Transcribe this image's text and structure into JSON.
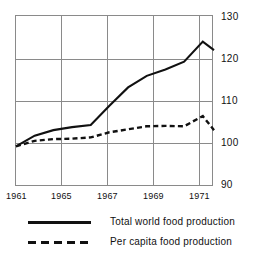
{
  "chart_data": {
    "type": "line",
    "title": "",
    "xlabel": "",
    "ylabel": "",
    "xlim": [
      1961,
      1971.6
    ],
    "ylim": [
      90,
      130
    ],
    "ytick_values": [
      130,
      120,
      110,
      100,
      90
    ],
    "ytick_labels": [
      "130",
      "120",
      "110",
      "100",
      "90"
    ],
    "xtick_values": [
      1961,
      1965,
      1967,
      1969,
      1971
    ],
    "xtick_labels": [
      "1961",
      "1965",
      "1967",
      "1969",
      "1971"
    ],
    "grid": "both",
    "legend_position": "below",
    "series": [
      {
        "name": "Total world food production",
        "style": "solid",
        "color": "#111111",
        "x": [
          1961,
          1962,
          1963,
          1964,
          1965,
          1966,
          1967,
          1968,
          1969,
          1970,
          1971,
          1971.6
        ],
        "values": [
          99.5,
          102.0,
          103.3,
          104.0,
          104.5,
          109.0,
          113.3,
          116.0,
          117.5,
          119.3,
          124.0,
          122.0
        ]
      },
      {
        "name": "Per capita food production",
        "style": "dashed",
        "color": "#111111",
        "x": [
          1961,
          1962,
          1963,
          1964,
          1965,
          1966,
          1967,
          1968,
          1969,
          1970,
          1971,
          1971.6
        ],
        "values": [
          99.5,
          100.8,
          101.2,
          101.3,
          101.6,
          102.8,
          103.5,
          104.2,
          104.3,
          104.2,
          106.6,
          103.3
        ]
      }
    ]
  },
  "axes": {
    "y_labels": [
      "130",
      "120",
      "110",
      "100",
      "90"
    ],
    "x_labels": [
      "1961",
      "1965",
      "1967",
      "1969",
      "1971"
    ]
  },
  "legend": {
    "items": [
      {
        "label": "Total world food production",
        "style": "solid"
      },
      {
        "label": "Per capita food production",
        "style": "dashed"
      }
    ]
  }
}
